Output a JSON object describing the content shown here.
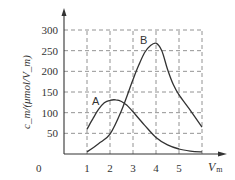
{
  "chart_data": {
    "type": "line",
    "title": "",
    "xlabel": "V_m",
    "ylabel": "c_m/(μmol/V_m)",
    "xlim": [
      0,
      6
    ],
    "ylim": [
      0,
      300
    ],
    "x_ticks": [
      "0",
      "1",
      "2",
      "3",
      "4",
      "5"
    ],
    "y_ticks": [
      "50",
      "100",
      "150",
      "200",
      "250",
      "300"
    ],
    "grid": true,
    "grid_style": "dashed",
    "legend": "none (curves labeled inline)",
    "series": [
      {
        "name": "A",
        "x": [
          1,
          1.25,
          1.5,
          1.75,
          2,
          2.25,
          2.5,
          2.75,
          3,
          3.5,
          4,
          4.5,
          5,
          5.5,
          6
        ],
        "values": [
          60,
          85,
          108,
          124,
          130,
          131,
          127,
          117,
          102,
          70,
          40,
          22,
          12,
          7,
          5
        ]
      },
      {
        "name": "B",
        "x": [
          1,
          1.5,
          2,
          2.5,
          3,
          3.25,
          3.5,
          3.75,
          4,
          4.25,
          4.5,
          4.75,
          5,
          5.5,
          6
        ],
        "values": [
          5,
          25,
          48,
          105,
          180,
          215,
          245,
          262,
          268,
          250,
          205,
          168,
          143,
          105,
          65
        ]
      }
    ]
  },
  "axes": {
    "origin_label": "0",
    "x_tick_labels": [
      "1",
      "2",
      "3",
      "4",
      "5"
    ],
    "y_tick_labels": [
      "50",
      "100",
      "150",
      "200",
      "250",
      "300"
    ],
    "x_axis_label_main": "V",
    "x_axis_label_sub": "m",
    "y_axis_label": "c_m/(μmol/V_m)"
  },
  "labels": {
    "curve_a": "A",
    "curve_b": "B"
  },
  "colors": {
    "line": "#333333",
    "grid": "#777777",
    "axis": "#333333"
  }
}
